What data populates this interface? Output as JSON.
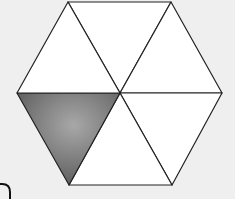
{
  "diagram": {
    "shape": "regular hexagon divided into 6 equilateral triangles",
    "total_parts": 6,
    "shaded_parts": 1,
    "fraction_shaded": "1/6",
    "colors": {
      "background": "#efefef",
      "fill": "#ffffff",
      "shaded": "#6a6a6a",
      "shaded_highlight": "#a8a8a8",
      "stroke": "#222222"
    }
  }
}
